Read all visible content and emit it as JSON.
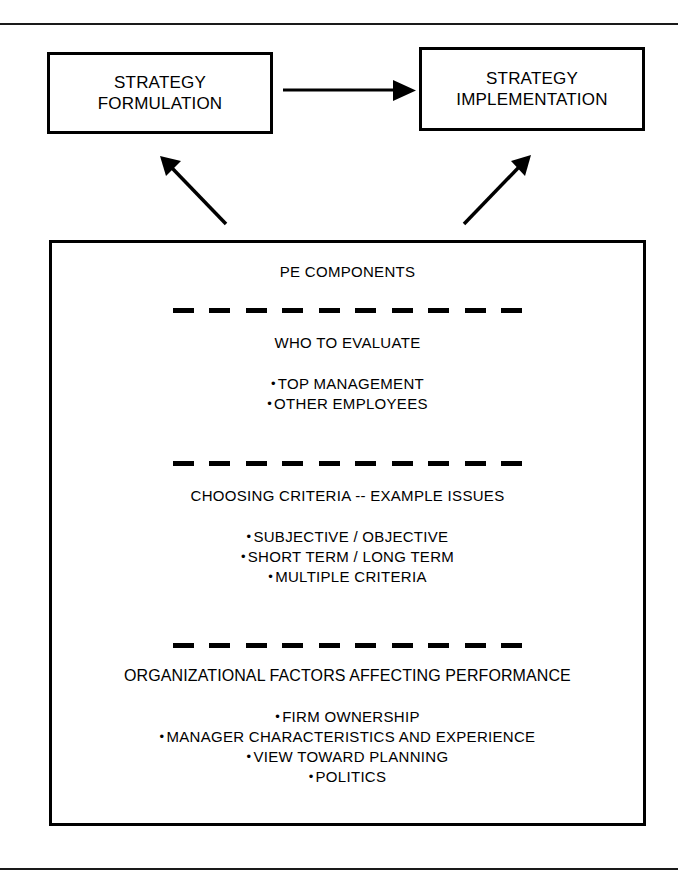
{
  "diagram": {
    "top_boxes": [
      {
        "id": "formulation",
        "line1": "STRATEGY",
        "line2": "FORMULATION"
      },
      {
        "id": "implementation",
        "line1": "STRATEGY",
        "line2": "IMPLEMENTATION"
      }
    ],
    "connectors": [
      {
        "id": "formulation-to-implementation",
        "type": "horizontal-arrow",
        "from": "STRATEGY FORMULATION",
        "to": "STRATEGY IMPLEMENTATION"
      },
      {
        "id": "components-to-formulation",
        "type": "diagonal-arrow",
        "from": "PE COMPONENTS",
        "to": "STRATEGY FORMULATION"
      },
      {
        "id": "components-to-implementation",
        "type": "diagonal-arrow",
        "from": "PE COMPONENTS",
        "to": "STRATEGY IMPLEMENTATION"
      }
    ],
    "components_box": {
      "title": "PE COMPONENTS",
      "sections": [
        {
          "id": "who-to-evaluate",
          "heading": "WHO TO EVALUATE",
          "bullets": [
            "TOP MANAGEMENT",
            "OTHER EMPLOYEES"
          ]
        },
        {
          "id": "choosing-criteria",
          "heading": "CHOOSING CRITERIA -- EXAMPLE ISSUES",
          "bullets": [
            "SUBJECTIVE / OBJECTIVE",
            "SHORT TERM / LONG TERM",
            "MULTIPLE CRITERIA"
          ]
        },
        {
          "id": "organizational-factors",
          "heading": "ORGANIZATIONAL FACTORS AFFECTING PERFORMANCE",
          "bullets": [
            "FIRM OWNERSHIP",
            "MANAGER CHARACTERISTICS AND EXPERIENCE",
            "VIEW TOWARD PLANNING",
            "POLITICS"
          ]
        }
      ]
    },
    "bullet_glyph": "•",
    "colors": {
      "ink": "#000000",
      "paper": "#ffffff",
      "rule": "#1a1a1a"
    }
  }
}
